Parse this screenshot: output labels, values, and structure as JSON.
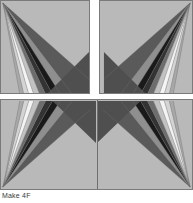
{
  "figure": {
    "caption": "Make 4F",
    "background_color": "#ffffff",
    "block_background_color": "#b9b9b9",
    "block_border_color": "#7a7a7a",
    "divider_color": "#6e6e6e"
  },
  "palette": {
    "white": "#f4f4f4",
    "near_white": "#e8e8e8",
    "light_gray": "#d4d4d4",
    "light_mid_gray": "#c2c2c2",
    "mid_gray": "#a8a8a8",
    "medium_gray": "#8f8f8f",
    "dark_mid_gray": "#6d6d6d",
    "dark_gray": "#4f4f4f",
    "very_dark_gray": "#333333",
    "black": "#1a1a1a",
    "background_gray": "#b9b9b9",
    "corner_gray": "#5a5a5a"
  },
  "blocks": [
    {
      "name": "top-left",
      "position": "top-left",
      "label": "Top left quilt block",
      "wedge_count": 9,
      "fan_origin": "top-left-corner",
      "corner_triangle": "bottom-right"
    },
    {
      "name": "top-right",
      "position": "top-right",
      "label": "Top right quilt block",
      "wedge_count": 9,
      "fan_origin": "top-right-corner",
      "corner_triangle": "bottom-left"
    },
    {
      "name": "bottom-left",
      "position": "bottom-left",
      "label": "Bottom left quilt block",
      "wedge_count": 9,
      "fan_origin": "bottom-left-corner",
      "corner_triangle": "top-right"
    },
    {
      "name": "bottom-right",
      "position": "bottom-right",
      "label": "Bottom right quilt block",
      "wedge_count": 9,
      "fan_origin": "bottom-right-corner",
      "corner_triangle": "top-left"
    }
  ]
}
